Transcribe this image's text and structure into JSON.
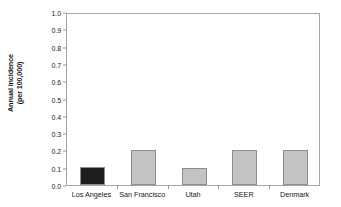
{
  "chart_data": {
    "type": "bar",
    "title": "",
    "xlabel": "",
    "ylabel": "Annual incidence (per 100,000)",
    "ylabel_line1": "Annual incidence",
    "ylabel_line2": "(per 100,000)",
    "categories": [
      "Los Angeles",
      "San Francisco",
      "Utah",
      "SEER",
      "Denmark"
    ],
    "values": [
      0.105,
      0.205,
      0.1,
      0.205,
      0.203
    ],
    "ylim": [
      0.0,
      1.0
    ],
    "ytick_labels": [
      "0.0",
      "0.1",
      "0.2",
      "0.3",
      "0.4",
      "0.5",
      "0.6",
      "0.7",
      "0.8",
      "0.9",
      "1.0"
    ],
    "ytick_values": [
      0.0,
      0.1,
      0.2,
      0.3,
      0.4,
      0.5,
      0.6,
      0.7,
      0.8,
      0.9,
      1.0
    ],
    "grid": false,
    "legend": null,
    "bar_colors": [
      "#1e1e1e",
      "#c3c3c3",
      "#c3c3c3",
      "#c3c3c3",
      "#c3c3c3"
    ],
    "bar_border_color": "#8d8d8d",
    "axis_color": "#a6a6a6",
    "background_color": "#ffffff",
    "text_color": "#1a1a1a"
  }
}
